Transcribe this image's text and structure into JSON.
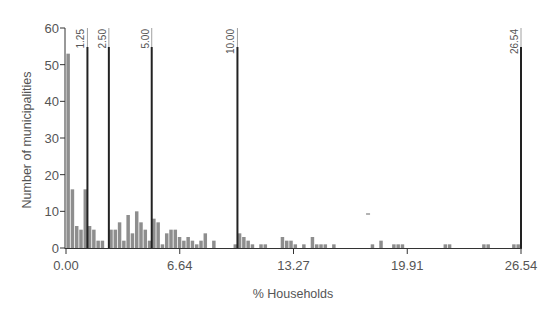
{
  "chart_data": {
    "type": "bar",
    "title": "",
    "xlabel": "% Households",
    "ylabel": "Number of municipalities",
    "xlim": [
      0,
      26.54
    ],
    "ylim": [
      0,
      60
    ],
    "bin_width": 0.25,
    "x_ticks": [
      {
        "value": 0,
        "label": "0.00"
      },
      {
        "value": 6.635,
        "label": "6.64"
      },
      {
        "value": 13.27,
        "label": "13.27"
      },
      {
        "value": 19.905,
        "label": "19.91"
      },
      {
        "value": 26.54,
        "label": "26.54"
      }
    ],
    "y_ticks": [
      0,
      10,
      20,
      30,
      40,
      50,
      60
    ],
    "reference_lines": [
      {
        "value": 1.25,
        "label": "1.25"
      },
      {
        "value": 2.5,
        "label": "2.50"
      },
      {
        "value": 5.0,
        "label": "5.00"
      },
      {
        "value": 10.0,
        "label": "10.00"
      },
      {
        "value": 26.54,
        "label": "26.54"
      }
    ],
    "bins_start": [
      0,
      0.25,
      0.5,
      0.75,
      1,
      1.25,
      1.5,
      1.75,
      2,
      2.25,
      2.5,
      2.75,
      3,
      3.25,
      3.5,
      3.75,
      4,
      4.25,
      4.5,
      4.75,
      5,
      5.25,
      5.5,
      5.75,
      6,
      6.25,
      6.5,
      6.75,
      7,
      7.25,
      7.5,
      7.75,
      8,
      8.25,
      8.5,
      8.75,
      9,
      9.25,
      9.5,
      9.75,
      10,
      10.25,
      10.5,
      10.75,
      11,
      11.25,
      11.5,
      11.75,
      12,
      12.25,
      12.5,
      12.75,
      13,
      13.25,
      13.5,
      13.75,
      14,
      14.25,
      14.5,
      14.75,
      15,
      15.25,
      15.5,
      15.75,
      16,
      16.25,
      16.5,
      16.75,
      17,
      17.25,
      17.5,
      17.75,
      18,
      18.25,
      18.5,
      18.75,
      19,
      19.25,
      19.5,
      19.75,
      20,
      20.25,
      20.5,
      20.75,
      21,
      21.25,
      21.5,
      21.75,
      22,
      22.25,
      22.5,
      22.75,
      23,
      23.25,
      23.5,
      23.75,
      24,
      24.25,
      24.5,
      24.75,
      25,
      25.25,
      25.5,
      25.75,
      26,
      26.25
    ],
    "values": [
      53,
      16,
      6,
      5,
      16,
      6,
      5,
      2,
      2,
      0,
      5,
      5,
      7,
      2,
      9,
      4,
      10,
      7,
      5,
      2,
      8,
      7,
      1,
      4,
      5,
      5,
      3,
      2,
      3,
      2,
      1,
      2,
      4,
      0,
      2,
      0,
      0,
      0,
      0,
      1,
      4,
      3,
      2,
      1,
      0,
      1,
      1,
      0,
      0,
      0,
      3,
      2,
      2,
      1,
      0,
      1,
      0,
      3,
      1,
      1,
      1,
      0,
      1,
      0,
      0,
      0,
      0,
      0,
      0,
      0,
      0,
      1,
      0,
      2,
      0,
      0,
      1,
      1,
      1,
      0,
      0,
      0,
      0,
      0,
      0,
      0,
      0,
      0,
      1,
      1,
      0,
      0,
      0,
      0,
      0,
      0,
      0,
      1,
      1,
      0,
      0,
      0,
      0,
      0,
      1,
      1,
      0,
      1
    ],
    "grid": false,
    "legend": null,
    "annotation_dash": {
      "x": 17.62,
      "y": 10
    }
  }
}
